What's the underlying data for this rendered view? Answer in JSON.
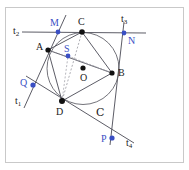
{
  "figure": {
    "kind": "geometry-diagram",
    "canvas": {
      "width": 189,
      "height": 170
    },
    "frame": {
      "x": 5,
      "y": 7,
      "width": 178,
      "height": 155,
      "stroke": "#c8c8c8"
    },
    "colors": {
      "black": "#111111",
      "blue": "#3a4fc4",
      "line": "#4a4a55",
      "circle": "#5a5a62",
      "dashed": "#8a8a92",
      "frame": "#c9c9c9",
      "background": "#ffffff"
    },
    "circle": {
      "label": "C",
      "center_label": "O",
      "cx": 83,
      "cy": 68.5,
      "r": 36,
      "label_x": 96,
      "label_y": 107
    },
    "points": [
      {
        "name": "A",
        "x": 48,
        "y": 50,
        "color": "black",
        "label": "A",
        "label_x": 36,
        "label_y": 42,
        "r": 2.6
      },
      {
        "name": "B",
        "x": 112,
        "y": 73,
        "color": "black",
        "label": "B",
        "label_x": 118,
        "label_y": 68,
        "r": 2.6
      },
      {
        "name": "C",
        "x": 82,
        "y": 32,
        "color": "black",
        "label": "C",
        "label_x": 78,
        "label_y": 17,
        "r": 2.8
      },
      {
        "name": "D",
        "x": 62,
        "y": 101,
        "color": "black",
        "label": "D",
        "label_x": 56,
        "label_y": 107,
        "r": 3.0
      },
      {
        "name": "O",
        "x": 83,
        "y": 68,
        "color": "black",
        "label": "O",
        "label_x": 80,
        "label_y": 73,
        "r": 2.6
      },
      {
        "name": "S",
        "x": 68,
        "y": 56,
        "color": "blue",
        "label": "S",
        "label_x": 64,
        "label_y": 44,
        "r": 2.4
      },
      {
        "name": "M",
        "x": 58,
        "y": 32,
        "color": "blue",
        "label": "M",
        "label_x": 50,
        "label_y": 18,
        "r": 2.4
      },
      {
        "name": "N",
        "x": 124,
        "y": 33,
        "color": "blue",
        "label": "N",
        "label_x": 128,
        "label_y": 36,
        "r": 2.4
      },
      {
        "name": "P",
        "x": 112,
        "y": 138,
        "color": "blue",
        "label": "P",
        "label_x": 101,
        "label_y": 134,
        "r": 2.6
      },
      {
        "name": "Q",
        "x": 33,
        "y": 85,
        "color": "blue",
        "label": "Q",
        "label_x": 20,
        "label_y": 78,
        "r": 2.6
      }
    ],
    "tangent_labels": [
      {
        "name": "t1",
        "base": "t",
        "sub": "1",
        "x": 15,
        "y": 96
      },
      {
        "name": "t2",
        "base": "t",
        "sub": "2",
        "x": 13,
        "y": 26
      },
      {
        "name": "t3",
        "base": "t",
        "sub": "3",
        "x": 121,
        "y": 14
      },
      {
        "name": "t4",
        "base": "t",
        "sub": "4",
        "x": 126,
        "y": 138
      }
    ],
    "segments": [
      {
        "name": "side-AB",
        "from": [
          48,
          50
        ],
        "to": [
          112,
          73
        ],
        "style": "solid",
        "color": "#4a4a55"
      },
      {
        "name": "side-BC",
        "from": [
          112,
          73
        ],
        "to": [
          82,
          32
        ],
        "style": "solid",
        "color": "#4a4a55"
      },
      {
        "name": "side-CD",
        "from": [
          82,
          32
        ],
        "to": [
          62,
          101
        ],
        "style": "dashed",
        "color": "#8a8a92"
      },
      {
        "name": "side-DA",
        "from": [
          62,
          101
        ],
        "to": [
          48,
          50
        ],
        "style": "solid",
        "color": "#4a4a55"
      },
      {
        "name": "diagonal-AC",
        "from": [
          48,
          50
        ],
        "to": [
          82,
          32
        ],
        "style": "solid",
        "color": "#4a4a55"
      },
      {
        "name": "diagonal-BD",
        "from": [
          112,
          73
        ],
        "to": [
          62,
          101
        ],
        "style": "solid",
        "color": "#4a4a55"
      },
      {
        "name": "chord-AO-B",
        "from": [
          48,
          50
        ],
        "to": [
          112,
          73
        ],
        "style": "dashed",
        "color": "#9a9aa2"
      },
      {
        "name": "chord-DS",
        "from": [
          62,
          101
        ],
        "to": [
          68,
          56
        ],
        "style": "dashed",
        "color": "#9a9aa2"
      },
      {
        "name": "chord-SB",
        "from": [
          68,
          56
        ],
        "to": [
          112,
          73
        ],
        "style": "dashed",
        "color": "#9a9aa2"
      },
      {
        "name": "tangent-t2-MN",
        "from": [
          22,
          32
        ],
        "to": [
          146,
          33
        ],
        "style": "solid",
        "color": "#4a4a55"
      },
      {
        "name": "tangent-t1-MQ",
        "from": [
          66,
          15
        ],
        "to": [
          24,
          108
        ],
        "style": "solid",
        "color": "#4a4a55"
      },
      {
        "name": "tangent-t3-NP",
        "from": [
          124,
          22
        ],
        "to": [
          110,
          145
        ],
        "style": "solid",
        "color": "#4a4a55"
      },
      {
        "name": "tangent-t4-QP",
        "from": [
          26,
          76
        ],
        "to": [
          134,
          143
        ],
        "style": "solid",
        "color": "#4a4a55"
      }
    ]
  }
}
